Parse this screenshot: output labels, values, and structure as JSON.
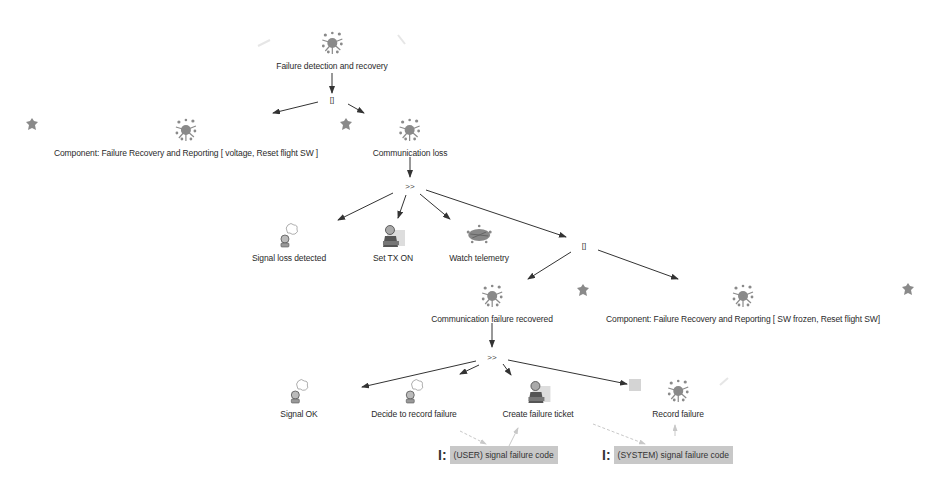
{
  "diagram": {
    "title": "Failure detection and recovery",
    "nodes": {
      "root": {
        "label": "Failure detection and recovery",
        "icon": "splat-icon"
      },
      "comp1": {
        "label": "Component: Failure Recovery and Reporting [ voltage, Reset flight SW ]",
        "icon": "splat-icon"
      },
      "comm_loss": {
        "label": "Communication loss",
        "icon": "splat-icon"
      },
      "signal_loss": {
        "label": "Signal loss detected",
        "icon": "thinking-user-icon"
      },
      "set_tx": {
        "label": "Set TX ON",
        "icon": "user-at-desk-icon"
      },
      "watch_tel": {
        "label": "Watch telemetry",
        "icon": "scribble-icon"
      },
      "comm_recovered": {
        "label": "Communication failure recovered",
        "icon": "splat-icon"
      },
      "comp2": {
        "label": "Component: Failure Recovery and Reporting [ SW frozen, Reset flight SW]",
        "icon": "splat-icon"
      },
      "signal_ok": {
        "label": "Signal OK",
        "icon": "thinking-user-icon"
      },
      "decide": {
        "label": "Decide to record failure",
        "icon": "thinking-user-icon"
      },
      "ticket": {
        "label": "Create failure ticket",
        "icon": "user-at-desk-icon"
      },
      "record": {
        "label": "Record failure",
        "icon": "splat-icon"
      }
    },
    "operators": {
      "op_choice1": "[]",
      "op_enable1": ">>",
      "op_choice2": "[]",
      "op_enable2": ">>"
    },
    "parameters": [
      {
        "prefix": "I:",
        "label": "(USER) signal failure code"
      },
      {
        "prefix": "I:",
        "label": "(SYSTEM) signal failure code"
      }
    ],
    "colors": {
      "edge": "#333333",
      "faint_edge": "#c0c0c0",
      "param_bg": "#c8c8c8",
      "icon_gray": "#8a8a8a"
    }
  }
}
